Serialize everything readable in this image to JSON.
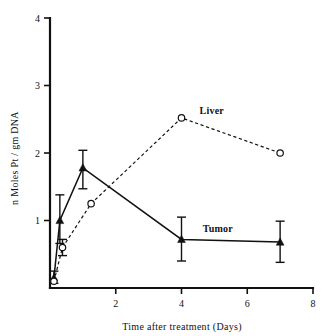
{
  "chart_data": {
    "type": "line",
    "title": "",
    "xlabel": "Time after treatment (Days)",
    "ylabel": "n Moles Pt / gm  DNA",
    "xlim": [
      0,
      8
    ],
    "ylim": [
      0,
      4
    ],
    "xticks": [
      "2",
      "4",
      "6",
      "8"
    ],
    "xtick_values": [
      2,
      4,
      6,
      8
    ],
    "yticks": [
      "1",
      "2",
      "3",
      "4"
    ],
    "ytick_values": [
      1,
      2,
      3,
      4
    ],
    "grid": false,
    "legend_position": "inline-annotation",
    "series": [
      {
        "name": "Tumor",
        "marker": "filled-triangle",
        "linestyle": "solid",
        "x": [
          0.12,
          0.3,
          1.0,
          4.0,
          7.0
        ],
        "values": [
          0.15,
          1.0,
          1.78,
          0.72,
          0.68
        ],
        "error_low": [
          0.08,
          0.34,
          0.31,
          0.32,
          0.3
        ],
        "error_high": [
          0.1,
          0.38,
          0.26,
          0.33,
          0.31
        ]
      },
      {
        "name": "Liver",
        "marker": "open-circle",
        "linestyle": "dashed",
        "x": [
          0.12,
          0.38,
          1.25,
          4.0,
          7.0
        ],
        "values": [
          0.1,
          0.6,
          1.25,
          2.52,
          2.0
        ],
        "error_low": [
          0.0,
          0.12,
          0.0,
          0.0,
          0.0
        ],
        "error_high": [
          0.0,
          0.12,
          0.0,
          0.0,
          0.0
        ]
      }
    ],
    "annotations": [
      {
        "text": "Liver",
        "x": 4.55,
        "y": 2.58
      },
      {
        "text": "Tumor",
        "x": 4.65,
        "y": 0.83
      }
    ]
  },
  "axes": {
    "x_title": "Time after treatment (Days)",
    "y_title": "n Moles Pt / gm  DNA"
  }
}
